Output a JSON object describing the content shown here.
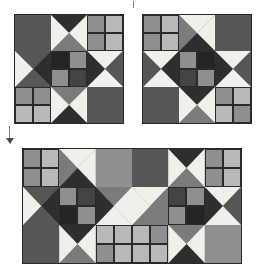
{
  "figure": {
    "kind": "quilt-block-diagram",
    "background_color": "#ffffff",
    "border_color": "#2a2a2a"
  },
  "palette": {
    "white": "#f0efe9",
    "light_gray": "#b9b9b9",
    "light_mid_gray": "#a6a6a6",
    "mid_gray": "#8f8f8f",
    "medium_gray": "#7b7b7b",
    "dark_gray": "#565656",
    "darker_gray": "#444444",
    "very_dark": "#2e2e2e",
    "near_black": "#242424",
    "outline": "#2a2a2a"
  },
  "blocks": [
    {
      "id": "block-top-left",
      "name": "Ohio star block A",
      "x": 14,
      "y": 14,
      "size": 108,
      "grid": 3,
      "cells": [
        {
          "pos": "top-left",
          "type": "solid",
          "fill": "dark_gray"
        },
        {
          "pos": "top-center",
          "type": "hourglass",
          "top": "very_dark",
          "right": "white",
          "bottom": "medium_gray",
          "left": "white"
        },
        {
          "pos": "top-right",
          "type": "fourpatch",
          "tl": "mid_gray",
          "tr": "light_gray",
          "bl": "mid_gray",
          "br": "light_gray"
        },
        {
          "pos": "mid-left",
          "type": "hourglass",
          "top": "dark_gray",
          "right": "very_dark",
          "bottom": "dark_gray",
          "left": "white"
        },
        {
          "pos": "center",
          "type": "fourpatch",
          "tl": "near_black",
          "tr": "mid_gray",
          "bl": "mid_gray",
          "br": "darker_gray"
        },
        {
          "pos": "mid-right",
          "type": "hourglass",
          "top": "white",
          "right": "dark_gray",
          "bottom": "white",
          "left": "very_dark"
        },
        {
          "pos": "bottom-left",
          "type": "fourpatch",
          "tl": "mid_gray",
          "tr": "mid_gray",
          "bl": "light_gray",
          "br": "light_gray"
        },
        {
          "pos": "bottom-center",
          "type": "hourglass",
          "top": "medium_gray",
          "right": "white",
          "bottom": "very_dark",
          "left": "white"
        },
        {
          "pos": "bottom-right",
          "type": "solid",
          "fill": "dark_gray"
        }
      ]
    },
    {
      "id": "block-top-right",
      "name": "Ohio star block B (mirrored)",
      "x": 142,
      "y": 14,
      "size": 108,
      "grid": 3,
      "cells": [
        {
          "pos": "top-left",
          "type": "fourpatch",
          "tl": "mid_gray",
          "tr": "light_gray",
          "bl": "mid_gray",
          "br": "light_gray"
        },
        {
          "pos": "top-center",
          "type": "hourglass",
          "top": "white",
          "right": "white",
          "bottom": "very_dark",
          "left": "medium_gray"
        },
        {
          "pos": "top-right",
          "type": "solid",
          "fill": "dark_gray"
        },
        {
          "pos": "mid-left",
          "type": "hourglass",
          "top": "white",
          "right": "very_dark",
          "bottom": "white",
          "left": "dark_gray"
        },
        {
          "pos": "center",
          "type": "fourpatch",
          "tl": "mid_gray",
          "tr": "near_black",
          "bl": "darker_gray",
          "br": "mid_gray"
        },
        {
          "pos": "mid-right",
          "type": "hourglass",
          "top": "white",
          "right": "dark_gray",
          "bottom": "white",
          "left": "very_dark"
        },
        {
          "pos": "bottom-left",
          "type": "solid",
          "fill": "dark_gray"
        },
        {
          "pos": "bottom-center",
          "type": "hourglass",
          "top": "very_dark",
          "right": "white",
          "bottom": "medium_gray",
          "left": "white"
        },
        {
          "pos": "bottom-right",
          "type": "fourpatch",
          "tl": "mid_gray",
          "tr": "light_gray",
          "bl": "light_gray",
          "br": "mid_gray"
        }
      ]
    },
    {
      "id": "block-bottom-strip",
      "name": "Two-block joined strip",
      "x": 22,
      "y": 148,
      "width": 218,
      "height": 114,
      "grid": 3,
      "units": 6,
      "cells": [
        {
          "pos": "r0c0",
          "type": "fourpatch",
          "tl": "mid_gray",
          "tr": "light_gray",
          "bl": "mid_gray",
          "br": "light_gray"
        },
        {
          "pos": "r0c1",
          "type": "hourglass",
          "top": "white",
          "right": "white",
          "bottom": "very_dark",
          "left": "medium_gray"
        },
        {
          "pos": "r0c2",
          "type": "solid",
          "fill": "mid_gray"
        },
        {
          "pos": "r0c3",
          "type": "solid",
          "fill": "dark_gray"
        },
        {
          "pos": "r0c4",
          "type": "hourglass",
          "top": "very_dark",
          "right": "white",
          "bottom": "medium_gray",
          "left": "white"
        },
        {
          "pos": "r0c5",
          "type": "fourpatch",
          "tl": "mid_gray",
          "tr": "light_gray",
          "bl": "mid_gray",
          "br": "light_gray"
        },
        {
          "pos": "r1c0",
          "type": "hourglass",
          "top": "dark_gray",
          "right": "very_dark",
          "bottom": "dark_gray",
          "left": "white"
        },
        {
          "pos": "r1c1",
          "type": "fourpatch",
          "tl": "mid_gray",
          "tr": "darker_gray",
          "bl": "near_black",
          "br": "mid_gray"
        },
        {
          "pos": "r1c2",
          "type": "hourglass",
          "top": "medium_gray",
          "right": "white",
          "bottom": "white",
          "left": "very_dark"
        },
        {
          "pos": "r1c3",
          "type": "hourglass",
          "top": "white",
          "right": "medium_gray",
          "bottom": "medium_gray",
          "left": "white"
        },
        {
          "pos": "r1c4",
          "type": "fourpatch",
          "tl": "darker_gray",
          "tr": "mid_gray",
          "bl": "mid_gray",
          "br": "near_black"
        },
        {
          "pos": "r1c5",
          "type": "hourglass",
          "top": "white",
          "right": "dark_gray",
          "bottom": "white",
          "left": "very_dark"
        },
        {
          "pos": "r2c0",
          "type": "solid",
          "fill": "dark_gray"
        },
        {
          "pos": "r2c1",
          "type": "hourglass",
          "top": "very_dark",
          "right": "white",
          "bottom": "medium_gray",
          "left": "white"
        },
        {
          "pos": "r2c2",
          "type": "fourpatch",
          "tl": "light_gray",
          "tr": "light_gray",
          "bl": "mid_gray",
          "br": "light_gray"
        },
        {
          "pos": "r2c3",
          "type": "fourpatch",
          "tl": "light_gray",
          "tr": "mid_gray",
          "bl": "light_gray",
          "br": "light_gray"
        },
        {
          "pos": "r2c4",
          "type": "hourglass",
          "top": "medium_gray",
          "right": "white",
          "bottom": "very_dark",
          "left": "white"
        },
        {
          "pos": "r2c5",
          "type": "solid",
          "fill": "mid_gray"
        }
      ]
    }
  ],
  "marks": [
    {
      "id": "top-tick",
      "x": 133,
      "y": 1,
      "w": 1,
      "h": 7,
      "label": "top registration tick"
    },
    {
      "id": "left-tick",
      "x": 9,
      "y": 126,
      "w": 1,
      "h": 12,
      "label": "left registration tick"
    },
    {
      "id": "left-arrow",
      "x": 6,
      "y": 138,
      "label": "left arrow head marker"
    }
  ]
}
